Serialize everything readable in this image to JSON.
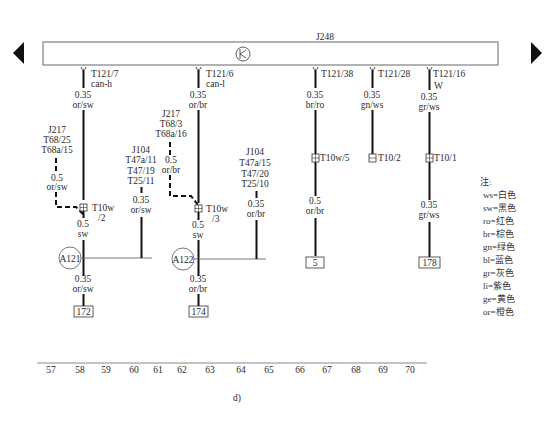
{
  "module": {
    "name": "J248",
    "symbol": "transistor-symbol"
  },
  "pins": [
    {
      "id": "T121/7",
      "sub": "can-h"
    },
    {
      "id": "T121/6",
      "sub": "can-l"
    },
    {
      "id": "T121/38",
      "sub": ""
    },
    {
      "id": "T121/28",
      "sub": ""
    },
    {
      "id": "T121/16",
      "sub": "W"
    }
  ],
  "wires": {
    "c58_top": {
      "size": "0.35",
      "color": "or/sw"
    },
    "c62_top": {
      "size": "0.35",
      "color": "or/br"
    },
    "c66_top": {
      "size": "0.35",
      "color": "br/ro"
    },
    "c68_top": {
      "size": "0.35",
      "color": "gn/ws"
    },
    "c70_top": {
      "size": "0.35",
      "color": "gr/ws"
    },
    "j217_a": {
      "size": "0.5",
      "color": "or/sw"
    },
    "j217_b": {
      "size": "0.5",
      "color": "or/br"
    },
    "j104_a": {
      "size": "0.35",
      "color": "or/sw"
    },
    "j104_b": {
      "size": "0.35",
      "color": "or/br"
    },
    "c58_mid": {
      "size": "0.5",
      "color": "sw"
    },
    "c62_mid": {
      "size": "0.5",
      "color": "sw"
    },
    "c58_bot": {
      "size": "0.35",
      "color": "or/sw"
    },
    "c62_bot": {
      "size": "0.35",
      "color": "or/br"
    },
    "c66_bot": {
      "size": "0.5",
      "color": "or/br"
    },
    "c70_bot": {
      "size": "0.35",
      "color": "gr/ws"
    }
  },
  "sources": {
    "j217_a": [
      "J217",
      "T68/25",
      "T68a/15"
    ],
    "j217_b": [
      "J217",
      "T68/3",
      "T68a/16"
    ],
    "j104_a": [
      "J104",
      "T47a/11",
      "T47/19",
      "T25/11"
    ],
    "j104_b": [
      "J104",
      "T47a/15",
      "T47/20",
      "T25/10"
    ]
  },
  "connectors": {
    "c58": [
      "T10w",
      "/2"
    ],
    "c62": [
      "T10w",
      "/3"
    ],
    "c66": "T10w/5",
    "c68": "T10/2",
    "c70": "T10/1"
  },
  "splices": {
    "a": "A121",
    "b": "A122"
  },
  "references": {
    "c58": "172",
    "c62": "174",
    "c66": "5",
    "c70": "178"
  },
  "legend": {
    "title": "注:",
    "items": [
      "ws=白色",
      "sw=黑色",
      "ro=红色",
      "br=棕色",
      "gn=绿色",
      "bl=蓝色",
      "gr=灰色",
      "li=紫色",
      "ge=黄色",
      "or=橙色"
    ]
  },
  "grid_numbers": [
    "57",
    "58",
    "59",
    "60",
    "61",
    "62",
    "63",
    "64",
    "65",
    "66",
    "67",
    "68",
    "69",
    "70"
  ],
  "figure_label": "d)"
}
